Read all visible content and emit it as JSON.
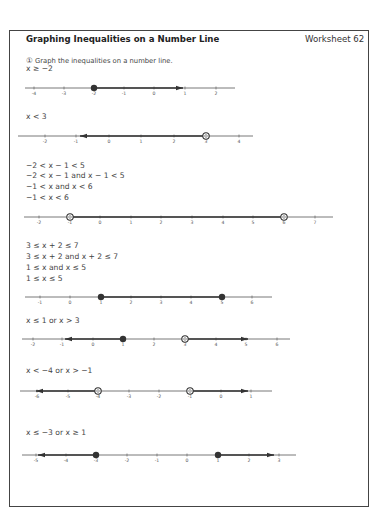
{
  "header": {
    "title": "Graphing Inequalities on a Number Line",
    "worksheet": "Worksheet 62"
  },
  "instruction": {
    "marker": "①",
    "text": "Graph the inequalities on a number line."
  },
  "problems": [
    {
      "steps": [
        "x ≥ −2"
      ],
      "number_line": {
        "y": 88,
        "x_start": 25,
        "x_end": 235,
        "ticks": [
          {
            "label": "-4",
            "x": 34
          },
          {
            "label": "-3",
            "x": 64
          },
          {
            "label": "-2",
            "x": 94
          },
          {
            "label": "-1",
            "x": 124
          },
          {
            "label": "0",
            "x": 154
          },
          {
            "label": "1",
            "x": 185
          },
          {
            "label": "2",
            "x": 216
          }
        ],
        "points": [
          {
            "value": -2,
            "x": 94,
            "type": "closed"
          }
        ],
        "rays": [
          {
            "from": 94,
            "to": 183,
            "arrow": "right"
          }
        ]
      }
    },
    {
      "steps": [
        "x < 3"
      ],
      "number_line": {
        "y": 136,
        "x_start": 18,
        "x_end": 253,
        "ticks": [
          {
            "label": "-2",
            "x": 45
          },
          {
            "label": "-1",
            "x": 76
          },
          {
            "label": "0",
            "x": 109
          },
          {
            "label": "1",
            "x": 141
          },
          {
            "label": "2",
            "x": 174
          },
          {
            "label": "3",
            "x": 206
          },
          {
            "label": "4",
            "x": 239
          }
        ],
        "points": [
          {
            "value": 3,
            "x": 206,
            "type": "open"
          }
        ],
        "rays": [
          {
            "from": 206,
            "to": 80,
            "arrow": "left"
          }
        ]
      }
    },
    {
      "steps": [
        "−2 < x − 1 < 5",
        "−2 < x − 1 and x − 1 < 5",
        "−1 < x and x < 6",
        "−1 < x < 6"
      ],
      "number_line": {
        "y": 217,
        "x_start": 24,
        "x_end": 333,
        "ticks": [
          {
            "label": "-2",
            "x": 39
          },
          {
            "label": "-1",
            "x": 70
          },
          {
            "label": "0",
            "x": 100
          },
          {
            "label": "1",
            "x": 131
          },
          {
            "label": "2",
            "x": 161
          },
          {
            "label": "3",
            "x": 192
          },
          {
            "label": "4",
            "x": 223
          },
          {
            "label": "5",
            "x": 253
          },
          {
            "label": "6",
            "x": 284
          },
          {
            "label": "7",
            "x": 315
          }
        ],
        "points": [
          {
            "value": -1,
            "x": 70,
            "type": "open"
          },
          {
            "value": 6,
            "x": 284,
            "type": "open"
          }
        ],
        "rays": [
          {
            "from": 70,
            "to": 284,
            "arrow": "none"
          }
        ]
      }
    },
    {
      "steps": [
        "3 ≤ x + 2 ≤ 7",
        "3 ≤ x + 2 and x + 2 ≤ 7",
        "1 ≤ x and x ≤ 5",
        "1 ≤ x ≤ 5"
      ],
      "number_line": {
        "y": 297,
        "x_start": 25,
        "x_end": 272,
        "ticks": [
          {
            "label": "-1",
            "x": 40
          },
          {
            "label": "0",
            "x": 70
          },
          {
            "label": "1",
            "x": 101
          },
          {
            "label": "2",
            "x": 131
          },
          {
            "label": "3",
            "x": 161
          },
          {
            "label": "4",
            "x": 191
          },
          {
            "label": "5",
            "x": 222
          },
          {
            "label": "6",
            "x": 252
          }
        ],
        "points": [
          {
            "value": 1,
            "x": 101,
            "type": "closed"
          },
          {
            "value": 5,
            "x": 222,
            "type": "closed"
          }
        ],
        "rays": [
          {
            "from": 101,
            "to": 222,
            "arrow": "none"
          }
        ]
      }
    },
    {
      "steps": [
        "x ≤ 1 or x > 3"
      ],
      "number_line": {
        "y": 339,
        "x_start": 22,
        "x_end": 290,
        "ticks": [
          {
            "label": "-2",
            "x": 33
          },
          {
            "label": "-1",
            "x": 62
          },
          {
            "label": "0",
            "x": 93
          },
          {
            "label": "1",
            "x": 123
          },
          {
            "label": "2",
            "x": 154
          },
          {
            "label": "3",
            "x": 185
          },
          {
            "label": "4",
            "x": 216
          },
          {
            "label": "5",
            "x": 246
          },
          {
            "label": "6",
            "x": 277
          }
        ],
        "points": [
          {
            "value": 1,
            "x": 123,
            "type": "closed"
          },
          {
            "value": 3,
            "x": 185,
            "type": "open"
          }
        ],
        "rays": [
          {
            "from": 123,
            "to": 65,
            "arrow": "left"
          },
          {
            "from": 185,
            "to": 248,
            "arrow": "right"
          }
        ]
      }
    },
    {
      "steps": [
        "x < −4 or x > −1"
      ],
      "number_line": {
        "y": 391,
        "x_start": 20,
        "x_end": 272,
        "ticks": [
          {
            "label": "-6",
            "x": 37
          },
          {
            "label": "-5",
            "x": 68
          },
          {
            "label": "-4",
            "x": 98
          },
          {
            "label": "-3",
            "x": 129
          },
          {
            "label": "-2",
            "x": 159
          },
          {
            "label": "-1",
            "x": 190
          },
          {
            "label": "0",
            "x": 221
          },
          {
            "label": "1",
            "x": 251
          }
        ],
        "points": [
          {
            "value": -4,
            "x": 98,
            "type": "open"
          },
          {
            "value": -1,
            "x": 190,
            "type": "open"
          }
        ],
        "rays": [
          {
            "from": 98,
            "to": 36,
            "arrow": "left"
          },
          {
            "from": 190,
            "to": 248,
            "arrow": "right"
          }
        ]
      }
    },
    {
      "steps": [
        "x ≤ −3 or x ≥ 1"
      ],
      "number_line": {
        "y": 455,
        "x_start": 22,
        "x_end": 296,
        "ticks": [
          {
            "label": "-5",
            "x": 36
          },
          {
            "label": "-4",
            "x": 66
          },
          {
            "label": "-3",
            "x": 96
          },
          {
            "label": "-2",
            "x": 127
          },
          {
            "label": "-1",
            "x": 157
          },
          {
            "label": "0",
            "x": 187
          },
          {
            "label": "1",
            "x": 218
          },
          {
            "label": "2",
            "x": 249
          },
          {
            "label": "3",
            "x": 279
          }
        ],
        "points": [
          {
            "value": -3,
            "x": 96,
            "type": "closed"
          },
          {
            "value": 1,
            "x": 218,
            "type": "closed"
          }
        ],
        "rays": [
          {
            "from": 96,
            "to": 38,
            "arrow": "left"
          },
          {
            "from": 218,
            "to": 274,
            "arrow": "right"
          }
        ]
      }
    }
  ],
  "layout": {
    "step_tops": [
      [
        64
      ],
      [
        112
      ],
      [
        161,
        171,
        182,
        193
      ],
      [
        241,
        252,
        263,
        274
      ],
      [
        316
      ],
      [
        366
      ],
      [
        428
      ]
    ]
  },
  "colors": {
    "line": "#555555",
    "ray": "#333333",
    "point": "#333333",
    "border": "#444444"
  }
}
